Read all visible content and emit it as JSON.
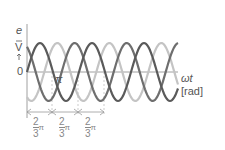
{
  "figure": {
    "y_axis": {
      "symbol": "e",
      "unit": "V"
    },
    "x_axis": {
      "symbol": "ωt",
      "unit": "[rad]"
    },
    "origin_label": "0",
    "pi_label": "π",
    "phase_shift": {
      "numerator": "2",
      "denominator": "3",
      "suffix": "π",
      "count": 3
    },
    "colors": {
      "phase_a": "#555555",
      "phase_b": "#666666",
      "phase_c": "#bbbbbb",
      "axis": "#888888",
      "arrow": "#999999"
    }
  }
}
